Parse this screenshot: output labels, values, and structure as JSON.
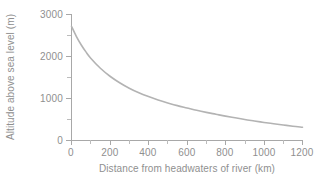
{
  "chart_data": {
    "type": "line",
    "title": "",
    "xlabel": "Distance from headwaters of river (km)",
    "ylabel": "Altitude above sea level (m)",
    "xlim": [
      0,
      1200
    ],
    "ylim": [
      0,
      3000
    ],
    "x_major_ticks": [
      0,
      200,
      400,
      600,
      800,
      1000,
      1200
    ],
    "x_minor_ticks": [
      100,
      300,
      500,
      700,
      900,
      1100
    ],
    "y_major_ticks": [
      0,
      1000,
      2000,
      3000
    ],
    "y_minor_ticks": [
      500,
      1500,
      2500
    ],
    "x_tick_labels": [
      "0",
      "200",
      "400",
      "600",
      "800",
      "1000",
      "1200"
    ],
    "y_tick_labels": [
      "0",
      "1000",
      "2000",
      "3000"
    ],
    "grid": false,
    "legend": false,
    "legend_position": "none",
    "series": [
      {
        "name": "River long profile",
        "color": "#b3b3b3",
        "x": [
          0,
          25,
          50,
          75,
          100,
          150,
          200,
          250,
          300,
          350,
          400,
          450,
          500,
          550,
          600,
          650,
          700,
          750,
          800,
          850,
          900,
          950,
          1000,
          1050,
          1100,
          1150,
          1200
        ],
        "values": [
          2720,
          2480,
          2280,
          2110,
          1960,
          1720,
          1530,
          1375,
          1245,
          1135,
          1045,
          965,
          895,
          830,
          775,
          720,
          670,
          625,
          580,
          540,
          500,
          465,
          430,
          400,
          370,
          340,
          315
        ]
      }
    ],
    "annotations": []
  },
  "axis_colors": {
    "axis": "#a8a8a8",
    "tick_minor": "#bcbcbc",
    "text": "#8f8f8f",
    "curve": "#b3b3b3",
    "background": "#ffffff"
  }
}
